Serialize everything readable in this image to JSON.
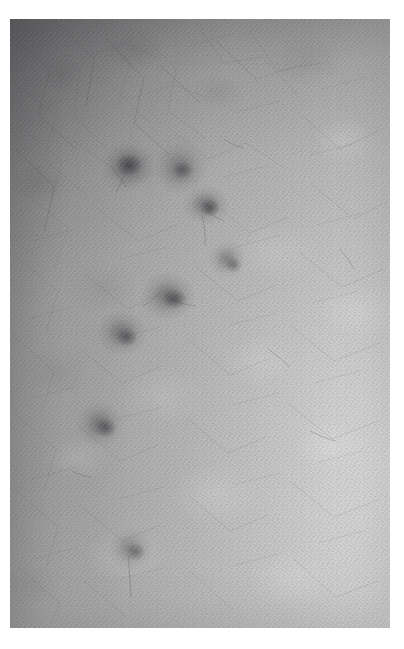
{
  "page": {
    "background_color": "#ffffff",
    "width": 404,
    "height": 649
  },
  "photograph": {
    "name": "skin-lesion-photograph",
    "type": "clinical dermatology macro photograph",
    "color_mode": "grayscale",
    "frame": {
      "x": 10,
      "y": 19,
      "width": 380,
      "height": 609
    },
    "background_tone_hex": "#a8a8a8",
    "darkest_tone_hex": "#6e6e72",
    "lightest_tone_hex": "#e2e2e2",
    "lighting": {
      "description": "Diffuse illumination, brighter toward lower-right, falling off to a darker upper-left corner",
      "bright_region": "lower-right",
      "dark_region": "upper-left"
    },
    "texture": {
      "description": "Fine skin grain with a criss-cross network of shallow skin creases and scattered fine hairs",
      "crease_direction_primary_deg": 38,
      "crease_direction_secondary_deg": -50
    }
  },
  "lesions": {
    "count": 8,
    "arrangement": "Loose diagonal cluster running from upper-centre down to lower-left",
    "items": [
      {
        "id": "lesion-1",
        "label": "Upper-left macule",
        "cx": 119,
        "cy": 147,
        "rx": 23,
        "ry": 19,
        "darkness": 0.46,
        "tone_hex": "#6f6f73"
      },
      {
        "id": "lesion-2",
        "label": "Upper-right macule",
        "cx": 170,
        "cy": 150,
        "rx": 19,
        "ry": 18,
        "darkness": 0.4,
        "tone_hex": "#76767a"
      },
      {
        "id": "lesion-3",
        "label": "Mid-upper macule",
        "cx": 196,
        "cy": 186,
        "rx": 18,
        "ry": 14,
        "darkness": 0.44,
        "tone_hex": "#717175"
      },
      {
        "id": "lesion-4",
        "label": "Right small macule",
        "cx": 217,
        "cy": 240,
        "rx": 14,
        "ry": 13,
        "darkness": 0.38,
        "tone_hex": "#7a7a7e"
      },
      {
        "id": "lesion-5",
        "label": "Central macule",
        "cx": 158,
        "cy": 277,
        "rx": 21,
        "ry": 17,
        "darkness": 0.45,
        "tone_hex": "#707074"
      },
      {
        "id": "lesion-6",
        "label": "Left macule",
        "cx": 112,
        "cy": 314,
        "rx": 19,
        "ry": 16,
        "darkness": 0.43,
        "tone_hex": "#737377"
      },
      {
        "id": "lesion-7",
        "label": "Lower-left macule",
        "cx": 90,
        "cy": 405,
        "rx": 18,
        "ry": 16,
        "darkness": 0.42,
        "tone_hex": "#747478"
      },
      {
        "id": "lesion-8",
        "label": "Bottom macule with trailing hair",
        "cx": 120,
        "cy": 530,
        "rx": 17,
        "ry": 15,
        "darkness": 0.36,
        "tone_hex": "#7d7d81"
      }
    ]
  }
}
